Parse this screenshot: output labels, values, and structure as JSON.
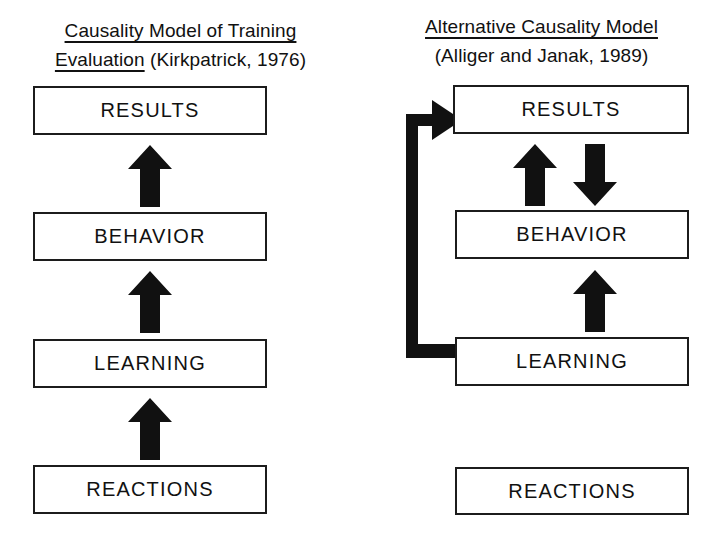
{
  "figure": {
    "type": "diagram",
    "background_color": "#ffffff",
    "line_color": "#111111"
  },
  "models": {
    "left": {
      "title_underlined": "Causality Model of Training Evaluation",
      "title_line1": "Causality Model of Training",
      "title_line2_underlined": "Evaluation",
      "title_line2_plain": " (Kirkpatrick, 1976)",
      "citation": "(Kirkpatrick, 1976)",
      "nodes": [
        {
          "id": "results",
          "label": "RESULTS"
        },
        {
          "id": "behavior",
          "label": "BEHAVIOR"
        },
        {
          "id": "learning",
          "label": "LEARNING"
        },
        {
          "id": "reactions",
          "label": "REACTIONS"
        }
      ],
      "arrows": [
        {
          "from": "behavior",
          "to": "results",
          "direction": "up",
          "style": "block"
        },
        {
          "from": "learning",
          "to": "behavior",
          "direction": "up",
          "style": "block"
        },
        {
          "from": "reactions",
          "to": "learning",
          "direction": "up",
          "style": "block"
        }
      ]
    },
    "right": {
      "title_underlined": "Alternative Causality Model",
      "title_line1": "Alternative Causality Model",
      "title_line2": "(Alliger and Janak, 1989)",
      "citation": "(Alliger and Janak, 1989)",
      "nodes": [
        {
          "id": "results",
          "label": "RESULTS"
        },
        {
          "id": "behavior",
          "label": "BEHAVIOR"
        },
        {
          "id": "learning",
          "label": "LEARNING"
        },
        {
          "id": "reactions",
          "label": "REACTIONS"
        }
      ],
      "arrows": [
        {
          "from": "behavior",
          "to": "results",
          "direction": "up",
          "style": "block"
        },
        {
          "from": "results",
          "to": "behavior",
          "direction": "down",
          "style": "block"
        },
        {
          "from": "learning",
          "to": "behavior",
          "direction": "up",
          "style": "block"
        },
        {
          "from": "learning",
          "to": "results",
          "direction": "elbow-left-up",
          "style": "block"
        }
      ]
    }
  }
}
